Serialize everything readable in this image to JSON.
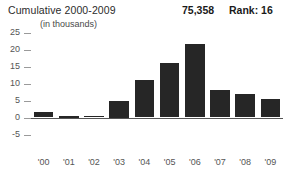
{
  "header": {
    "title": "Cumulative 2000-2009",
    "subtitle": "(in thousands)",
    "total": "75,358",
    "rank": "Rank: 16"
  },
  "axis": {
    "y_ticks": [
      "25",
      "20",
      "15",
      "10",
      "5",
      "0",
      "-5"
    ],
    "x_ticks": [
      "'00",
      "'01",
      "'02",
      "'03",
      "'04",
      "'05",
      "'06",
      "'07",
      "'08",
      "'09"
    ]
  },
  "colors": {
    "bar": "#262626",
    "axis": "#555555",
    "text": "#2b2b2b",
    "background": "#ffffff"
  },
  "chart_data": {
    "type": "bar",
    "title": "Cumulative 2000-2009",
    "subtitle": "(in thousands)",
    "xlabel": "",
    "ylabel": "",
    "categories": [
      "'00",
      "'01",
      "'02",
      "'03",
      "'04",
      "'05",
      "'06",
      "'07",
      "'08",
      "'09"
    ],
    "values": [
      1.5,
      0.2,
      0.5,
      5.0,
      11.0,
      16.0,
      21.5,
      8.0,
      7.0,
      5.5
    ],
    "ylim": [
      -5,
      25
    ],
    "yticks": [
      25,
      20,
      15,
      10,
      5,
      0,
      -5
    ],
    "grid": false,
    "legend": "none",
    "total": "75,358",
    "rank": "Rank: 16"
  }
}
